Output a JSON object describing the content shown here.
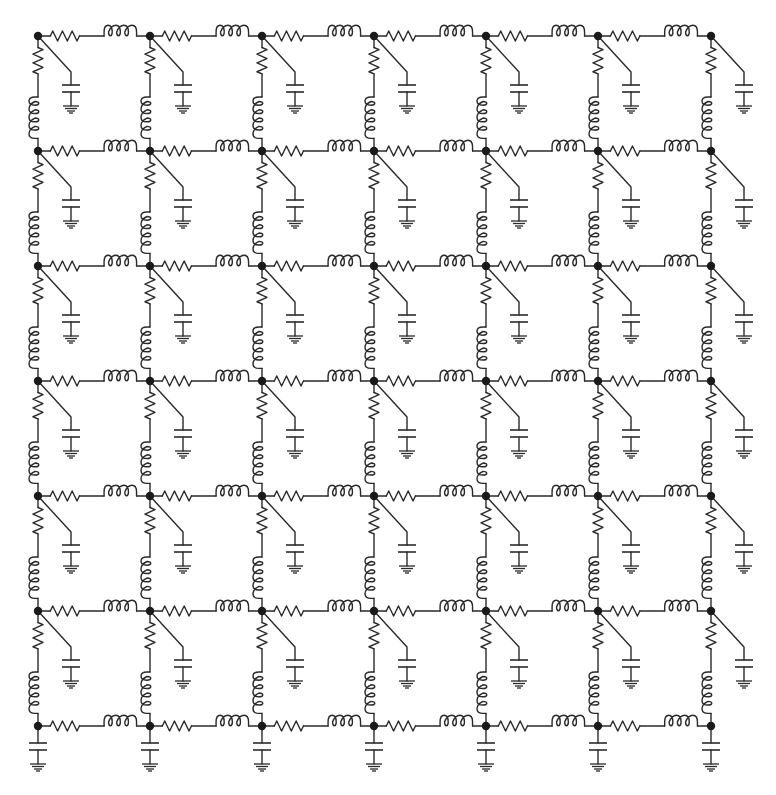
{
  "diagram": {
    "grid": {
      "columns": 7,
      "rows": 7,
      "node_x": [
        38,
        150,
        262,
        374,
        486,
        598,
        711
      ],
      "node_y": [
        36,
        151,
        266,
        381,
        496,
        611,
        726
      ]
    },
    "components": {
      "horizontal_branch": [
        "resistor",
        "inductor"
      ],
      "vertical_branch": [
        "resistor",
        "inductor"
      ],
      "shunt": [
        "capacitor",
        "ground"
      ]
    },
    "icons": {
      "node": "junction-dot-icon",
      "resistor": "resistor-icon",
      "inductor": "inductor-icon",
      "capacitor": "capacitor-icon",
      "ground": "ground-icon"
    },
    "colors": {
      "line": "#2a2a2a",
      "node": "#1a1a1a",
      "background": "#ffffff"
    }
  }
}
